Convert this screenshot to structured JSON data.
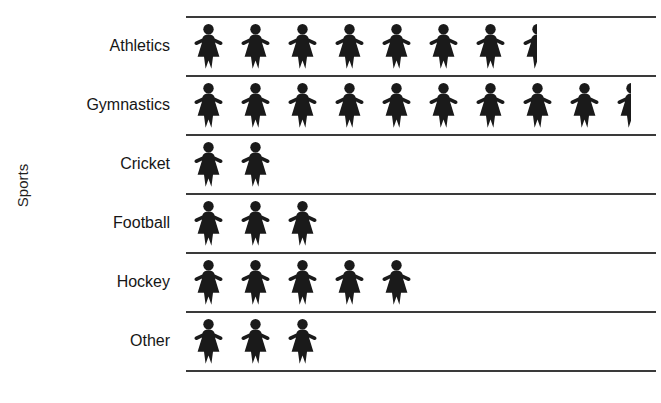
{
  "chart_data": {
    "type": "bar",
    "subtype": "pictograph",
    "title": "",
    "xlabel": "",
    "ylabel": "Sports",
    "categories": [
      "Athletics",
      "Gymnastics",
      "Cricket",
      "Football",
      "Hockey",
      "Other"
    ],
    "values": [
      7.5,
      9.5,
      2,
      3,
      5,
      3
    ],
    "icon": "person-figure-icon",
    "icon_full_count": [
      7,
      9,
      2,
      3,
      5,
      3
    ],
    "icon_half_count": [
      1,
      1,
      0,
      0,
      0,
      0
    ],
    "grid": true,
    "legend": "none",
    "orientation": "horizontal",
    "colors": {
      "icon": "#1a1a1a",
      "rule": "#3a3a3a",
      "text": "#161616",
      "background": "#ffffff"
    }
  },
  "axis": {
    "y_title": "Sports"
  },
  "header": {
    "title": ""
  },
  "rows": [
    {
      "label": "Athletics",
      "full": 7,
      "half": 1,
      "value": 7.5
    },
    {
      "label": "Gymnastics",
      "full": 9,
      "half": 1,
      "value": 9.5
    },
    {
      "label": "Cricket",
      "full": 2,
      "half": 0,
      "value": 2
    },
    {
      "label": "Football",
      "full": 3,
      "half": 0,
      "value": 3
    },
    {
      "label": "Hockey",
      "full": 5,
      "half": 0,
      "value": 5
    },
    {
      "label": "Other",
      "full": 3,
      "half": 0,
      "value": 3
    }
  ]
}
